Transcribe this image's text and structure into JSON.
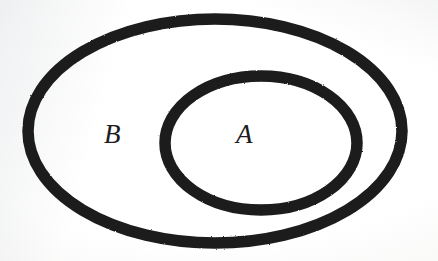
{
  "figure": {
    "kind": "euler-diagram",
    "background_color": "#fdfdfd",
    "stroke_color": "#1c1c1c",
    "label_color": "#1d1d1d",
    "canvas": {
      "width": 438,
      "height": 261
    }
  },
  "chart_data": {
    "type": "diagram",
    "title": "",
    "sets": [
      {
        "label": "B",
        "role": "superset",
        "shape": "ellipse",
        "center": [
          215,
          131
        ],
        "rx": 187,
        "ry": 112,
        "stroke_width": 11,
        "stroke_color": "#1c1c1c",
        "fill": "none",
        "label_position": [
          114,
          135
        ]
      },
      {
        "label": "A",
        "role": "subset",
        "shape": "ellipse",
        "center": [
          261,
          143
        ],
        "rx": 96,
        "ry": 67,
        "stroke_width": 11,
        "stroke_color": "#1c1c1c",
        "fill": "none",
        "label_position": [
          246,
          135
        ]
      }
    ],
    "relation": "A is a subset of B",
    "annotations": []
  },
  "labels": {
    "outer_set": "B",
    "inner_set": "A"
  }
}
